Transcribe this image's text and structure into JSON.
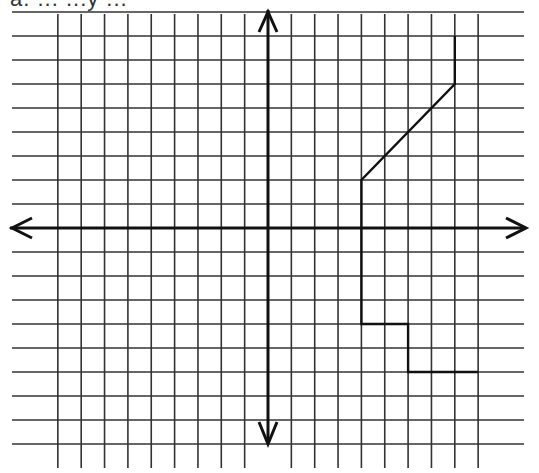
{
  "header_fragment": "a. ... ...y ...",
  "chart_data": {
    "type": "line",
    "title": "",
    "grid": true,
    "xlim": [
      -10,
      10
    ],
    "ylim": [
      -9,
      9
    ],
    "xlabel": "",
    "ylabel": "",
    "series": [
      {
        "name": "path",
        "points": [
          [
            8,
            8
          ],
          [
            8,
            6
          ],
          [
            4,
            2
          ],
          [
            4,
            -4
          ],
          [
            6,
            -4
          ],
          [
            6,
            -6
          ],
          [
            9,
            -6
          ]
        ]
      }
    ]
  },
  "layout": {
    "origin_px": [
      268,
      228
    ],
    "unit_x_px": 23.35,
    "unit_y_px": 24.0,
    "grid_x_units": [
      -10,
      10
    ],
    "grid_y_units": [
      -9,
      9
    ],
    "grid_color": "#333333",
    "axis_color": "#111111",
    "path_color": "#111111"
  }
}
